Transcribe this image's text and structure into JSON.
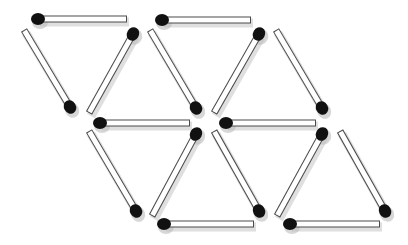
{
  "puzzle": {
    "title": "Matchstick triangles puzzle",
    "match_count": 16,
    "triangle_count": 8,
    "colors": {
      "background": "#ffffff",
      "stick_body": "#ffffff",
      "stick_outline": "#4a4a4a",
      "head": "#111111",
      "shadow": "#c9c9c9"
    },
    "stick_width": 7,
    "head_radius_x": 7,
    "head_radius_y": 6,
    "matches": [
      {
        "id": "match-1",
        "head": [
          38,
          19
        ],
        "tail": [
          127,
          19
        ]
      },
      {
        "id": "match-2",
        "head": [
          70,
          107
        ],
        "tail": [
          24,
          30
        ]
      },
      {
        "id": "match-3",
        "head": [
          133,
          34
        ],
        "tail": [
          89,
          113
        ]
      },
      {
        "id": "match-4",
        "head": [
          162,
          20
        ],
        "tail": [
          251,
          20
        ]
      },
      {
        "id": "match-5",
        "head": [
          196,
          108
        ],
        "tail": [
          150,
          30
        ]
      },
      {
        "id": "match-6",
        "head": [
          259,
          34
        ],
        "tail": [
          214,
          113
        ]
      },
      {
        "id": "match-7",
        "head": [
          322,
          108
        ],
        "tail": [
          276,
          30
        ]
      },
      {
        "id": "match-8",
        "head": [
          100,
          123
        ],
        "tail": [
          190,
          123
        ]
      },
      {
        "id": "match-9",
        "head": [
          226,
          123
        ],
        "tail": [
          316,
          123
        ]
      },
      {
        "id": "match-10",
        "head": [
          136,
          211
        ],
        "tail": [
          89,
          131
        ]
      },
      {
        "id": "match-11",
        "head": [
          196,
          134
        ],
        "tail": [
          152,
          216
        ]
      },
      {
        "id": "match-12",
        "head": [
          259,
          211
        ],
        "tail": [
          214,
          131
        ]
      },
      {
        "id": "match-13",
        "head": [
          322,
          134
        ],
        "tail": [
          277,
          216
        ]
      },
      {
        "id": "match-14",
        "head": [
          385,
          211
        ],
        "tail": [
          340,
          131
        ]
      },
      {
        "id": "match-15",
        "head": [
          164,
          224
        ],
        "tail": [
          254,
          224
        ]
      },
      {
        "id": "match-16",
        "head": [
          290,
          224
        ],
        "tail": [
          380,
          224
        ]
      }
    ]
  }
}
